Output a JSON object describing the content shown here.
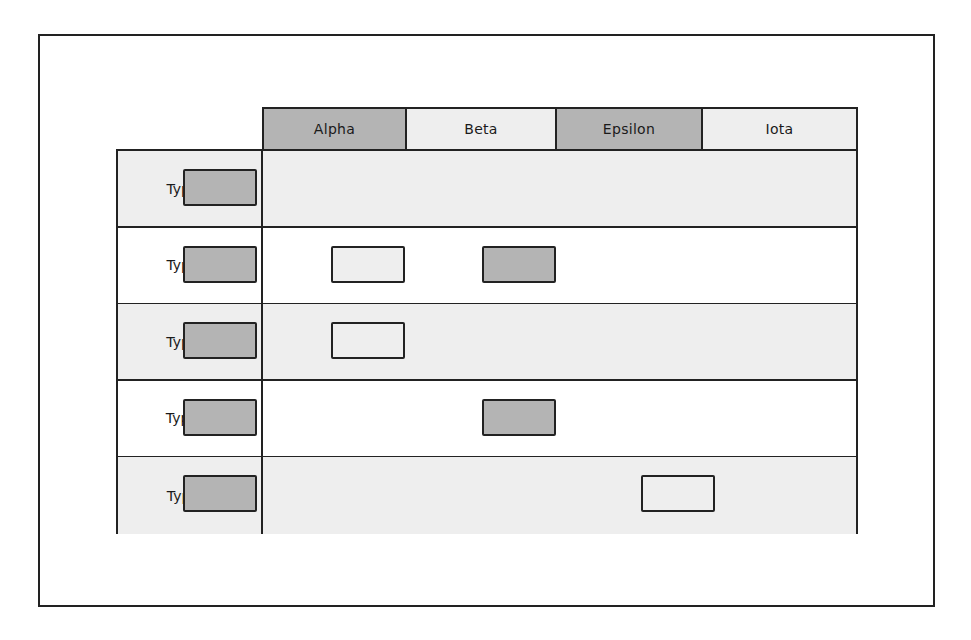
{
  "colors": {
    "dark_fill": "#b4b4b4",
    "light_fill": "#eeeeee",
    "white_fill": "#ffffff",
    "stroke": "#222222"
  },
  "columns": [
    {
      "label": "Alpha",
      "fill": "dark"
    },
    {
      "label": "Beta",
      "fill": "light"
    },
    {
      "label": "Epsilon",
      "fill": "dark"
    },
    {
      "label": "Iota",
      "fill": "light"
    }
  ],
  "rows": [
    {
      "label": "Type A",
      "bg": "light",
      "cells": [
        "dark",
        null,
        null,
        null
      ]
    },
    {
      "label": "Type B",
      "bg": "white",
      "cells": [
        "dark",
        "light",
        "dark",
        null
      ]
    },
    {
      "label": "Type C",
      "bg": "light",
      "cells": [
        "dark",
        "light",
        null,
        null
      ]
    },
    {
      "label": "Type D",
      "bg": "white",
      "cells": [
        "dark",
        null,
        "dark",
        null
      ]
    },
    {
      "label": "Type E",
      "bg": "light",
      "cells": [
        "dark",
        null,
        null,
        "light"
      ]
    }
  ]
}
